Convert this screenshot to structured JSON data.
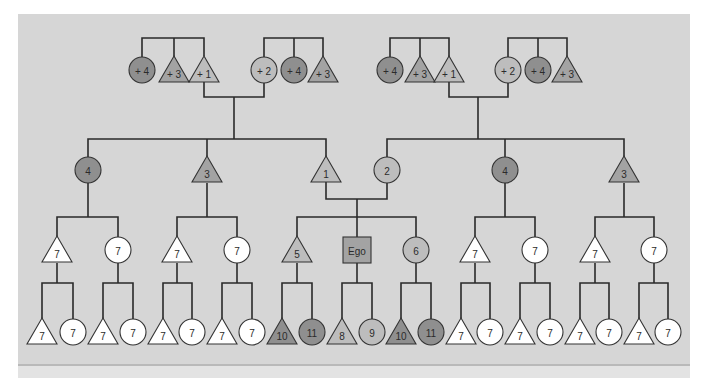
{
  "diagram": {
    "type": "kinship-chart",
    "colors": {
      "background": "#d6d6d6",
      "line": "#2a2a2a",
      "white": "#ffffff",
      "light": "#bdbdbd",
      "medium": "#a3a3a3",
      "dark": "#8f8f8f"
    },
    "nodes": [
      {
        "id": "gp1",
        "shape": "circle",
        "label": "+ 4",
        "fill": "dark"
      },
      {
        "id": "gp2",
        "shape": "triangle",
        "label": "+ 3",
        "fill": "medium"
      },
      {
        "id": "gp3",
        "shape": "triangle",
        "label": "+ 1",
        "fill": "light"
      },
      {
        "id": "gp4",
        "shape": "circle",
        "label": "+ 2",
        "fill": "light"
      },
      {
        "id": "gp5",
        "shape": "circle",
        "label": "+ 4",
        "fill": "dark"
      },
      {
        "id": "gp6",
        "shape": "triangle",
        "label": "+ 3",
        "fill": "medium"
      },
      {
        "id": "gp7",
        "shape": "circle",
        "label": "+ 4",
        "fill": "dark"
      },
      {
        "id": "gp8",
        "shape": "triangle",
        "label": "+ 3",
        "fill": "medium"
      },
      {
        "id": "gp9",
        "shape": "triangle",
        "label": "+ 1",
        "fill": "light"
      },
      {
        "id": "gp10",
        "shape": "circle",
        "label": "+ 2",
        "fill": "light"
      },
      {
        "id": "gp11",
        "shape": "circle",
        "label": "+ 4",
        "fill": "dark"
      },
      {
        "id": "gp12",
        "shape": "triangle",
        "label": "+ 3",
        "fill": "medium"
      },
      {
        "id": "p1",
        "shape": "circle",
        "label": "4",
        "fill": "dark"
      },
      {
        "id": "p2",
        "shape": "triangle",
        "label": "3",
        "fill": "medium"
      },
      {
        "id": "p3",
        "shape": "triangle",
        "label": "1",
        "fill": "light"
      },
      {
        "id": "p4",
        "shape": "circle",
        "label": "2",
        "fill": "light"
      },
      {
        "id": "p5",
        "shape": "circle",
        "label": "4",
        "fill": "dark"
      },
      {
        "id": "p6",
        "shape": "triangle",
        "label": "3",
        "fill": "medium"
      },
      {
        "id": "c1",
        "shape": "triangle",
        "label": "7",
        "fill": "white"
      },
      {
        "id": "c2",
        "shape": "circle",
        "label": "7",
        "fill": "white"
      },
      {
        "id": "c3",
        "shape": "triangle",
        "label": "7",
        "fill": "white"
      },
      {
        "id": "c4",
        "shape": "circle",
        "label": "7",
        "fill": "white"
      },
      {
        "id": "c5",
        "shape": "triangle",
        "label": "5",
        "fill": "light"
      },
      {
        "id": "ego",
        "shape": "square",
        "label": "Ego",
        "fill": "medium"
      },
      {
        "id": "c6",
        "shape": "circle",
        "label": "6",
        "fill": "light"
      },
      {
        "id": "c7",
        "shape": "triangle",
        "label": "7",
        "fill": "white"
      },
      {
        "id": "c8",
        "shape": "circle",
        "label": "7",
        "fill": "white"
      },
      {
        "id": "c9",
        "shape": "triangle",
        "label": "7",
        "fill": "white"
      },
      {
        "id": "c10",
        "shape": "circle",
        "label": "7",
        "fill": "white"
      },
      {
        "id": "g1",
        "shape": "triangle",
        "label": "7",
        "fill": "white"
      },
      {
        "id": "g2",
        "shape": "circle",
        "label": "7",
        "fill": "white"
      },
      {
        "id": "g3",
        "shape": "triangle",
        "label": "7",
        "fill": "white"
      },
      {
        "id": "g4",
        "shape": "circle",
        "label": "7",
        "fill": "white"
      },
      {
        "id": "g5",
        "shape": "triangle",
        "label": "7",
        "fill": "white"
      },
      {
        "id": "g6",
        "shape": "circle",
        "label": "7",
        "fill": "white"
      },
      {
        "id": "g7",
        "shape": "triangle",
        "label": "7",
        "fill": "white"
      },
      {
        "id": "g8",
        "shape": "circle",
        "label": "7",
        "fill": "white"
      },
      {
        "id": "g9",
        "shape": "triangle",
        "label": "10",
        "fill": "dark"
      },
      {
        "id": "g10",
        "shape": "circle",
        "label": "11",
        "fill": "dark"
      },
      {
        "id": "g11",
        "shape": "triangle",
        "label": "8",
        "fill": "light"
      },
      {
        "id": "g12",
        "shape": "circle",
        "label": "9",
        "fill": "light"
      },
      {
        "id": "g13",
        "shape": "triangle",
        "label": "10",
        "fill": "dark"
      },
      {
        "id": "g14",
        "shape": "circle",
        "label": "11",
        "fill": "dark"
      },
      {
        "id": "g15",
        "shape": "triangle",
        "label": "7",
        "fill": "white"
      },
      {
        "id": "g16",
        "shape": "circle",
        "label": "7",
        "fill": "white"
      },
      {
        "id": "g17",
        "shape": "triangle",
        "label": "7",
        "fill": "white"
      },
      {
        "id": "g18",
        "shape": "circle",
        "label": "7",
        "fill": "white"
      },
      {
        "id": "g19",
        "shape": "triangle",
        "label": "7",
        "fill": "white"
      },
      {
        "id": "g20",
        "shape": "circle",
        "label": "7",
        "fill": "white"
      },
      {
        "id": "g21",
        "shape": "triangle",
        "label": "7",
        "fill": "white"
      },
      {
        "id": "g22",
        "shape": "circle",
        "label": "7",
        "fill": "white"
      }
    ]
  }
}
